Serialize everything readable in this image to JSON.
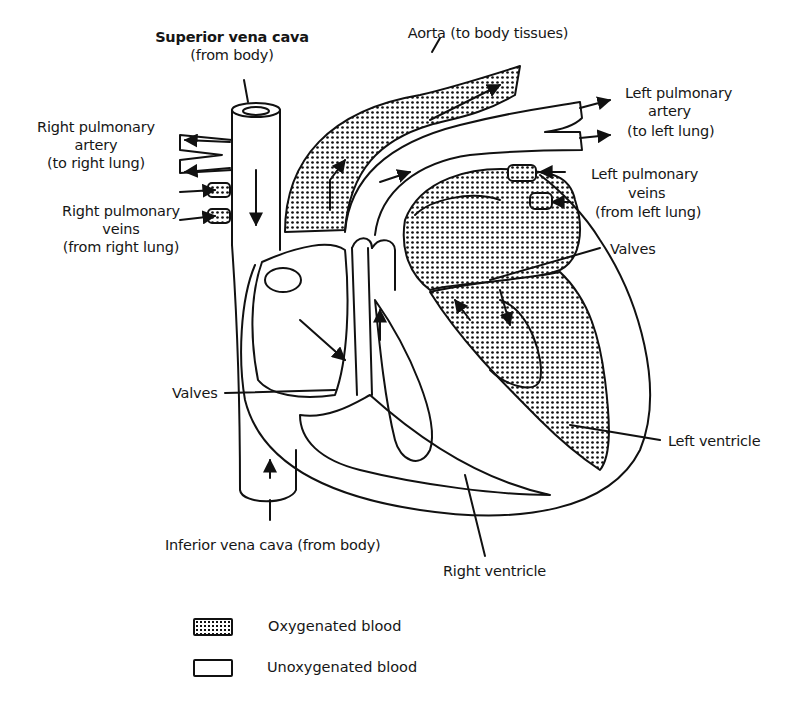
{
  "figure": {
    "labels": {
      "superior_vena_cava": "Superior vena cava",
      "superior_vena_cava_note": "(from body)",
      "aorta": "Aorta (to body tissues)",
      "right_pulmonary_artery_1": "Right pulmonary",
      "right_pulmonary_artery_2": "artery",
      "right_pulmonary_artery_3": "(to right lung)",
      "right_pulmonary_veins_1": "Right pulmonary",
      "right_pulmonary_veins_2": "veins",
      "right_pulmonary_veins_3": "(from right lung)",
      "left_pulmonary_artery_1": "Left pulmonary",
      "left_pulmonary_artery_2": "artery",
      "left_pulmonary_artery_3": "(to left lung)",
      "left_pulmonary_veins_1": "Left pulmonary",
      "left_pulmonary_veins_2": "veins",
      "left_pulmonary_veins_3": "(from left lung)",
      "valves_right": "Valves",
      "valves_left": "Valves",
      "left_ventricle": "Left ventricle",
      "inferior_vena_cava": "Inferior vena cava (from body)",
      "right_ventricle": "Right ventricle"
    },
    "legend": [
      {
        "label": "Oxygenated blood",
        "pattern": "stippled"
      },
      {
        "label": "Unoxygenated blood",
        "pattern": "blank"
      }
    ],
    "colors": {
      "ink": "#111111",
      "paper": "#ffffff"
    }
  }
}
